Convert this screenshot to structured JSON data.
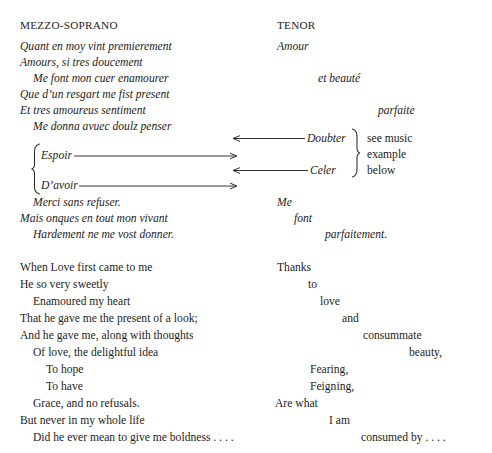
{
  "page": {
    "background_color": "#ffffff",
    "text_color": "#1d1d1b",
    "rule_color": "#2a2a28"
  },
  "headers": {
    "left_voice": "MEZZO-SOPRANO",
    "right_voice": "TENOR"
  },
  "old_french": {
    "mezzo_soprano": [
      "Quant en moy vint premierement",
      "Amours, si tres doucement",
      "Me font mon cuer enamourer",
      "Que d’un resgart me fist present",
      "Et tres amoureus sentiment",
      "Me donna avuec doulz penser",
      "Merci sans refuser.",
      "Mais onques en tout mon vivant",
      "Hardement ne me vost donner."
    ],
    "braced_terms": [
      "Espoir",
      "D’avoir"
    ],
    "tenor": [
      "Amour",
      "et beauté",
      "parfaite",
      "Me",
      "font",
      "parfaitement."
    ],
    "tenor_braced_terms": [
      "Doubter",
      "Celer"
    ]
  },
  "annotation": {
    "line1": "see music",
    "line2": "example",
    "line3": "below"
  },
  "english": {
    "mezzo_soprano": [
      "When Love first came to me",
      "He so very sweetly",
      "Enamoured my heart",
      "That he gave me the present of a look;",
      "And he gave me, along with thoughts",
      "Of love, the delightful idea",
      "To hope",
      "To have",
      "Grace, and no refusals.",
      "But never in my whole life",
      "Did he ever mean to give me boldness . . . ."
    ],
    "tenor": [
      "Thanks",
      "to",
      "love",
      "and",
      "consummate",
      "beauty,",
      "Fearing,",
      "Feigning,",
      "Are what",
      "I am",
      "consumed by . . . ."
    ]
  }
}
